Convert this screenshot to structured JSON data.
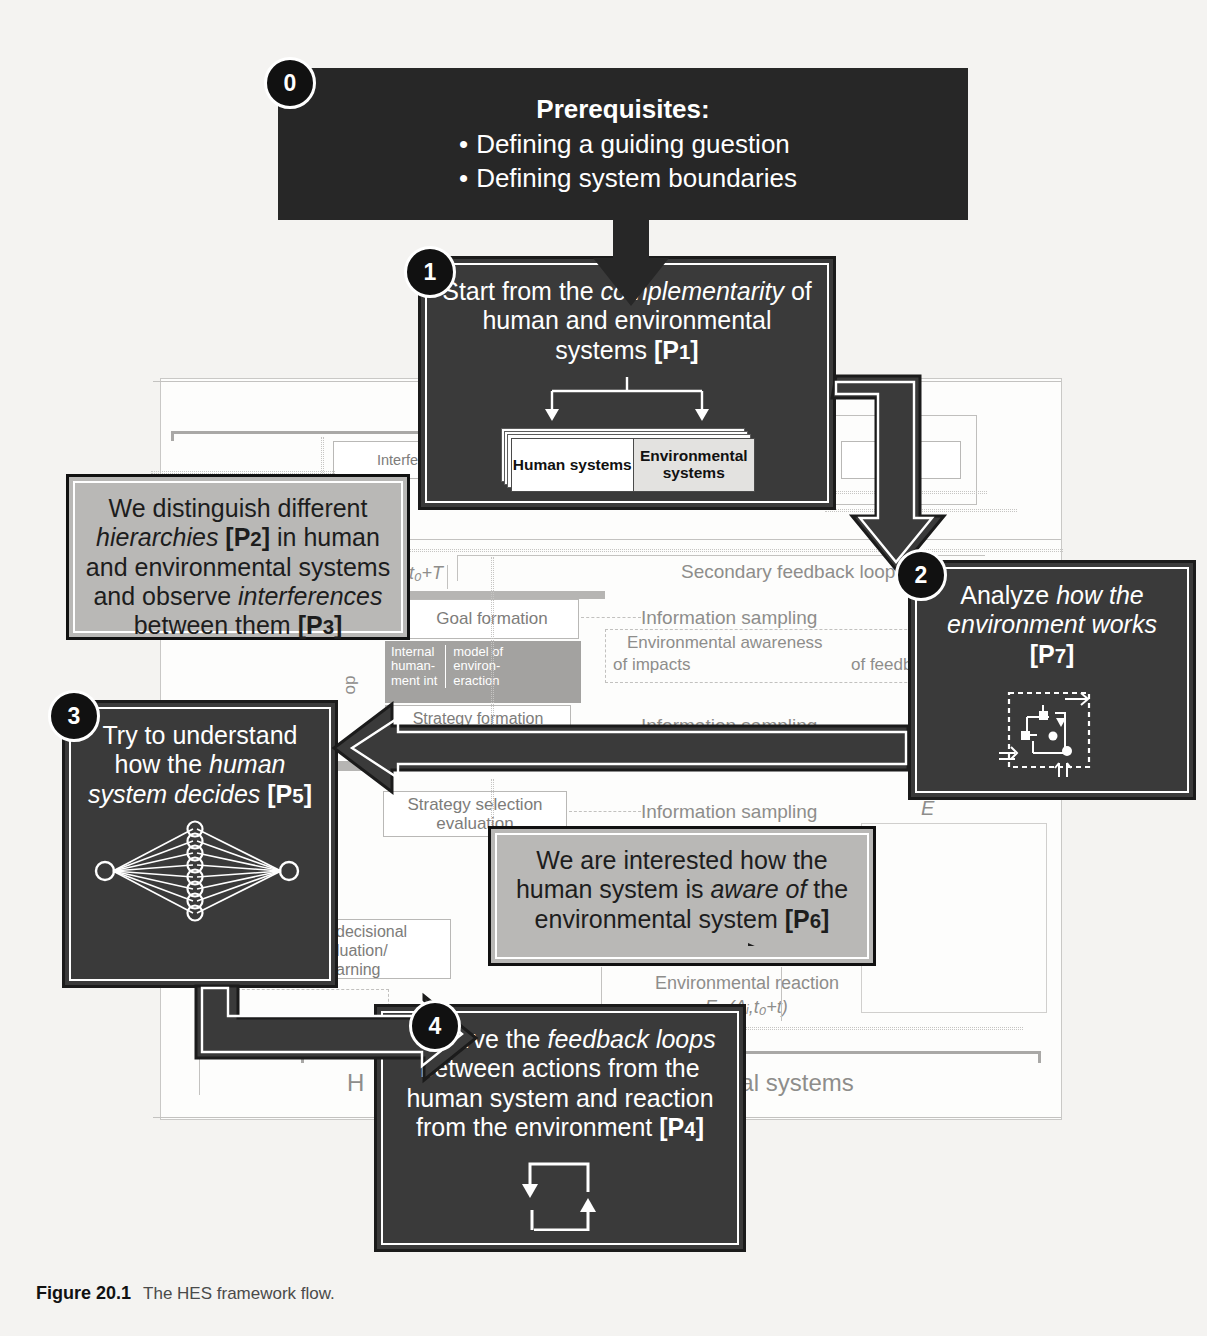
{
  "figure": {
    "label": "Figure 20.1",
    "caption": "The HES framework flow."
  },
  "colors": {
    "dark_box": "#3a3a3a",
    "black_box": "#272727",
    "light_box": "#b9b8b6",
    "badge": "#111111",
    "page_bg": "#f4f3f1"
  },
  "steps": [
    {
      "number": "0",
      "kind": "prerequisites",
      "title": "Prerequisites:",
      "bullets": [
        "Defining a guiding guestion",
        "Defining system boundaries"
      ]
    },
    {
      "number": "1",
      "kind": "dark",
      "text_parts": [
        "Start from the ",
        "complementarity",
        " of human and environmental systems ",
        "[P1]"
      ],
      "text_plain": "Start from the complementarity of human and environmental systems [P1]",
      "cards": [
        "Human systems",
        "Environmental systems"
      ],
      "principle": "P1"
    },
    {
      "number": "2",
      "kind": "dark",
      "text_plain": "Analyze how the environment works [P7]",
      "icon": "environment-system-icon",
      "principle": "P7"
    },
    {
      "number": "3",
      "kind": "dark",
      "text_plain": "Try to understand how the human system decides [P5]",
      "icon": "neural-network-icon",
      "principle": "P5"
    },
    {
      "number": "4",
      "kind": "dark",
      "text_plain": "Observe the feedback loops between actions from the human system and reaction from the environment [P4]",
      "icon": "feedback-loop-icon",
      "principle": "P4"
    }
  ],
  "annotations": [
    {
      "id": "hierarchies",
      "kind": "light",
      "text_plain": "We distinguish different hierarchies [P2] in human and environmental systems and observe interferences between them [P3]",
      "principles": [
        "P2",
        "P3"
      ]
    },
    {
      "id": "awareness",
      "kind": "light",
      "text_plain": "We are interested how the human system is aware of the environmental system [P6]",
      "principles": [
        "P6"
      ],
      "icon": "dashed-arrow-icon"
    }
  ],
  "background_diagram": {
    "title_fragment": "H",
    "labels": [
      "Interferen",
      "ences",
      "t₀+T",
      "Secondary feedback loop",
      "Goal formation",
      "Information sampling",
      "Environmental awareness",
      "of impacts",
      "of feedbacks",
      "Internal",
      "model of",
      "human-",
      "environ-",
      "ment int",
      "eraction",
      "Strategy formation",
      "S=(s₁, ..., sⱼ, ..., sₙ)",
      "Environmental awareness",
      "Strategy selection",
      "evaluation",
      "Information sampling",
      "E",
      "decisional",
      "luation/",
      "arning",
      "Environmental reaction",
      "Eᵥ (Aᵢ,t₀+t)",
      "op",
      "H",
      "ental systems"
    ],
    "bottom_brace_labels": [
      "H",
      "ental systems"
    ]
  }
}
